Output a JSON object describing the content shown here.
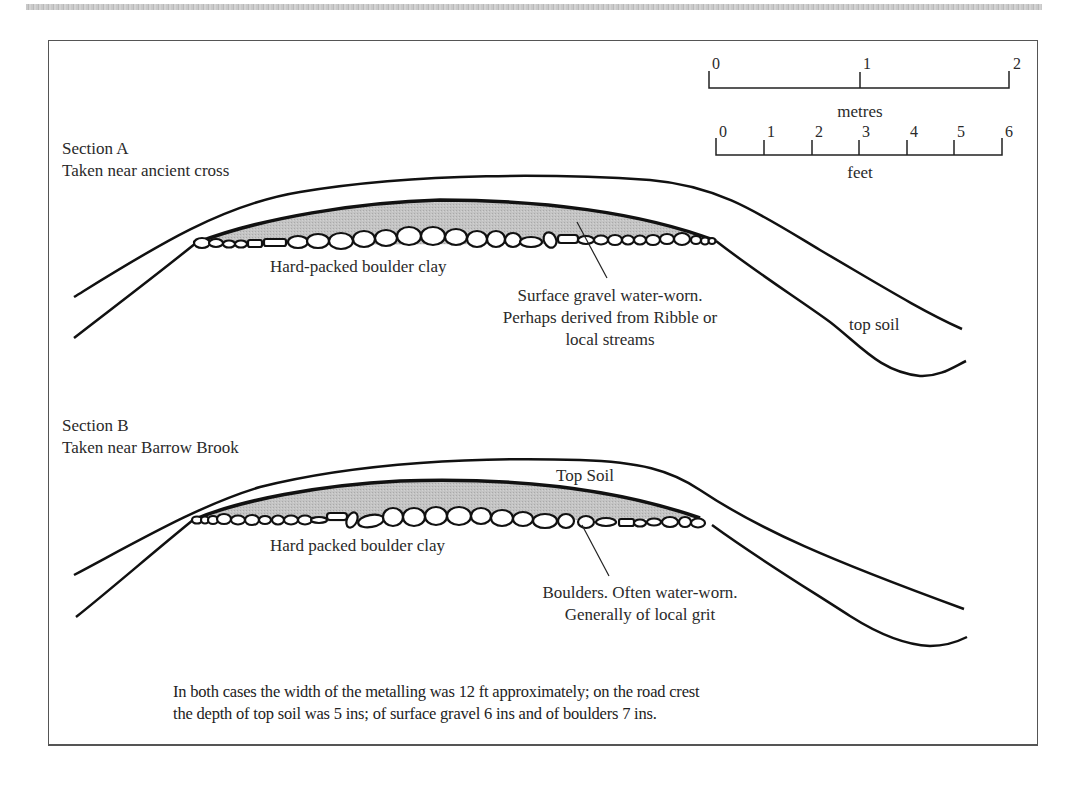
{
  "figure": {
    "scale": {
      "metres": {
        "label": "metres",
        "ticks": [
          "0",
          "1",
          "2"
        ]
      },
      "feet": {
        "label": "feet",
        "ticks": [
          "0",
          "1",
          "2",
          "3",
          "4",
          "5",
          "6"
        ]
      }
    },
    "section_a": {
      "title": "Section A",
      "subtitle": "Taken near ancient cross",
      "base_label": "Hard-packed boulder clay",
      "gravel_annotation": {
        "line1": "Surface gravel water-worn.",
        "line2": "Perhaps derived from Ribble or",
        "line3": "local streams"
      },
      "top_soil_label": "top soil"
    },
    "section_b": {
      "title": "Section B",
      "subtitle": "Taken near Barrow Brook",
      "top_soil_label": "Top Soil",
      "base_label": "Hard packed boulder clay",
      "boulder_annotation": {
        "line1": "Boulders. Often water-worn.",
        "line2": "Generally of local grit"
      }
    },
    "footnote": {
      "line1": "In both cases the width of the metalling was 12 ft approximately; on the road crest",
      "line2": "the depth of top soil was 5 ins; of surface gravel 6 ins and of boulders 7 ins."
    },
    "colors": {
      "line": "#111111",
      "gravel_fill": "#bdbdbd",
      "frame": "#555555"
    }
  }
}
